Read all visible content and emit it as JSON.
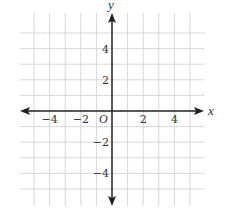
{
  "chart_data": {
    "type": "coordinate-grid",
    "title": "",
    "xlabel": "x",
    "ylabel": "y",
    "origin_label": "O",
    "xlim": [
      -5,
      5
    ],
    "ylim": [
      -5,
      5
    ],
    "grid": true,
    "grid_step": 1,
    "x_ticks": [
      {
        "value": -4,
        "label": "−4"
      },
      {
        "value": -2,
        "label": "−2"
      },
      {
        "value": 2,
        "label": "2"
      },
      {
        "value": 4,
        "label": "4"
      }
    ],
    "y_ticks": [
      {
        "value": 4,
        "label": "4"
      },
      {
        "value": 2,
        "label": "2"
      },
      {
        "value": -2,
        "label": "−2"
      },
      {
        "value": -4,
        "label": "−4"
      }
    ],
    "series": []
  },
  "colors": {
    "axis": "#222222",
    "grid": "#c9c9c9",
    "text": "#333333"
  },
  "icons": {
    "x_arrow_right": "arrow-right-icon",
    "x_arrow_left": "arrow-left-icon",
    "y_arrow_up": "arrow-up-icon",
    "y_arrow_down": "arrow-down-icon"
  }
}
